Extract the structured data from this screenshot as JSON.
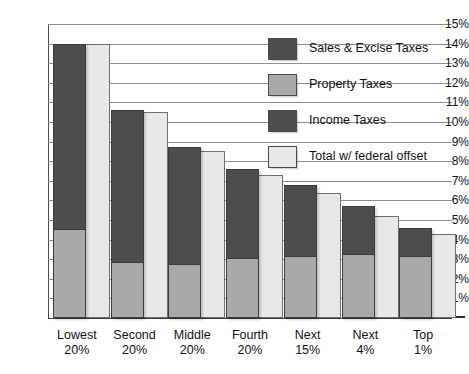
{
  "chart_data": {
    "type": "bar",
    "subtype": "stacked-bar-with-comparison-bar",
    "title": "",
    "subtitle": "",
    "xlabel": "",
    "ylabel": "",
    "ylim": [
      0,
      15
    ],
    "ytick_step": 1,
    "grid": true,
    "legend_position": "upper-right-inside",
    "categories": [
      "Lowest 20%",
      "Second 20%",
      "Middle 20%",
      "Fourth 20%",
      "Next 15%",
      "Next 4%",
      "Top 1%"
    ],
    "category_lines": [
      [
        "Lowest",
        "20%"
      ],
      [
        "Second",
        "20%"
      ],
      [
        "Middle",
        "20%"
      ],
      [
        "Fourth",
        "20%"
      ],
      [
        "Next",
        "15%"
      ],
      [
        "Next",
        "4%"
      ],
      [
        "Top",
        "1%"
      ]
    ],
    "ytick_labels": [
      "15%",
      "14%",
      "13%",
      "12%",
      "11%",
      "10%",
      "9%",
      "8%",
      "7%",
      "6%",
      "5%",
      "4%",
      "3%",
      "2%",
      "1%"
    ],
    "ytick_values": [
      15,
      14,
      13,
      12,
      11,
      10,
      9,
      8,
      7,
      6,
      5,
      4,
      3,
      2,
      1
    ],
    "zero_tick_label": "",
    "series": [
      {
        "name": "Sales & Excise Taxes",
        "color": "#4d4d4d",
        "values": [
          9.4,
          7.7,
          5.9,
          4.5,
          3.6,
          2.4,
          1.4
        ]
      },
      {
        "name": "Property Taxes",
        "color": "#a9a9a7",
        "values": [
          4.6,
          2.9,
          2.8,
          3.1,
          3.2,
          3.3,
          3.2
        ]
      },
      {
        "name": "Income Taxes",
        "color": "#4d4d4d",
        "values": [
          0.0,
          0.0,
          0.0,
          0.0,
          0.0,
          0.0,
          0.0
        ]
      },
      {
        "name": "Total w/ federal offset",
        "color": "#e8e8e6",
        "values": [
          14.0,
          10.5,
          8.5,
          7.3,
          6.4,
          5.2,
          4.3
        ]
      }
    ],
    "totals": [
      14.0,
      10.6,
      8.7,
      7.6,
      6.8,
      5.7,
      4.6
    ],
    "total_labels": [
      "14.0%",
      "10.6%",
      "8.7%",
      "7.6%",
      "6.8%",
      "5.7%",
      "4.6%"
    ]
  },
  "legend": {
    "items": [
      {
        "label": "Sales & Excise Taxes",
        "swatch": "dark"
      },
      {
        "label": "Property Taxes",
        "swatch": "medium"
      },
      {
        "label": "Income Taxes",
        "swatch": "dark"
      },
      {
        "label": "Total w/ federal offset",
        "swatch": "light"
      }
    ]
  },
  "colors": {
    "dark": "#4d4d4d",
    "medium": "#a9a9a7",
    "light": "#e8e8e6",
    "gridline": "#8d8d8d",
    "axis": "#3a3a3a",
    "background": "#ffffff"
  }
}
